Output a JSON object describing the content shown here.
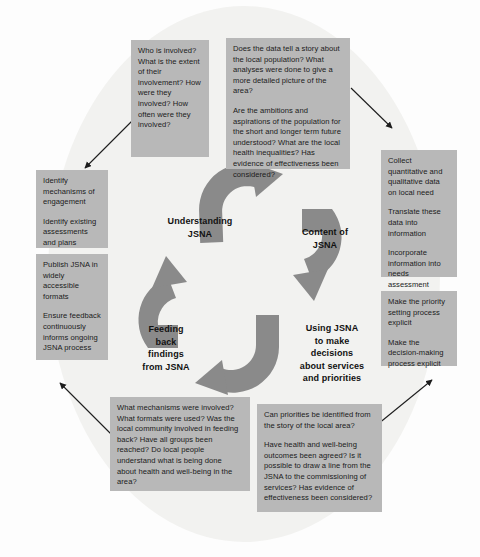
{
  "diagram": {
    "colors": {
      "background": "#fdfdfd",
      "ellipse": "#f2f2f0",
      "box_fill": "#b8b8b8",
      "arrow_fill": "#8a8a8a",
      "connector": "#222222",
      "text": "#1b1b1b"
    },
    "center_labels": {
      "understanding": "Understanding\nJSNA",
      "content": "Content of\nJSNA",
      "feeding_back": "Feeding\nback\nfindings\nfrom JSNA",
      "using": "Using JSNA\nto make\ndecisions\nabout services\nand priorities"
    },
    "center_labels_lines": {
      "understanding": [
        "Understanding",
        "JSNA"
      ],
      "content": [
        "Content of",
        "JSNA"
      ],
      "feeding_back": [
        "Feeding",
        "back",
        "findings",
        "from JSNA"
      ],
      "using": [
        "Using JSNA",
        "to make",
        "decisions",
        "about services",
        "and priorities"
      ]
    },
    "boxes": {
      "top_left_questions": {
        "paragraphs": [
          "Who is involved? What is the extent of their involvement? How were they involved? How often were they involved?"
        ]
      },
      "top_right_questions": {
        "paragraphs": [
          "Does the data tell a story about the local population? What analyses were done to give a more detailed picture of the area?",
          "Are the ambitions and aspirations of the population for the short and longer term future understood? What are the local health inequalities? Has evidence of effectiveness been considered?"
        ]
      },
      "left_upper_actions": {
        "paragraphs": [
          "Identify mechanisms of engagement",
          "Identify existing assessments and plans"
        ]
      },
      "left_lower_actions": {
        "paragraphs": [
          "Publish JSNA in widely accessible formats",
          "Ensure feedback continuously informs ongoing JSNA process"
        ]
      },
      "right_upper_actions": {
        "paragraphs": [
          "Collect quantitative and qualitative data on local need",
          "Translate these data into information",
          "Incorporate information into needs assessment"
        ]
      },
      "right_lower_actions": {
        "paragraphs": [
          "Make the priority setting process explicit",
          "Make the decision-making process explicit"
        ]
      },
      "bottom_left_questions": {
        "paragraphs": [
          "What mechanisms were involved? What formats were used? Was the local community involved in feeding back? Have all groups been reached? Do local people understand what is being done about health and well-being in the area?"
        ]
      },
      "bottom_right_questions": {
        "paragraphs": [
          "Can priorities be identified from the story of the local area?",
          "Have health and well-being outcomes been agreed? Is it possible to draw a line from the JSNA to the commissioning of services? Has evidence of effectiveness been considered?"
        ]
      }
    }
  }
}
